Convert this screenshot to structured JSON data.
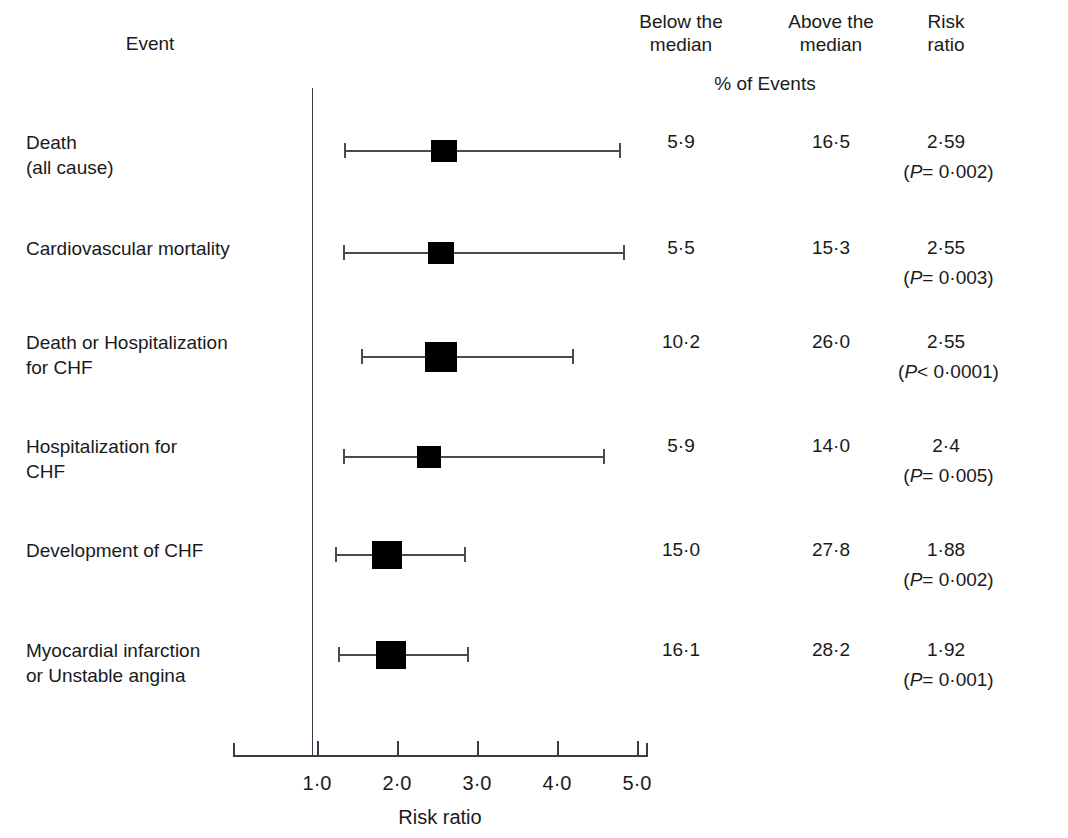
{
  "header": {
    "event_label": "Event",
    "below_median": "Below the\nmedian",
    "above_median": "Above the\nmedian",
    "risk_ratio": "Risk\nratio",
    "pct_of_events": "%  of Events"
  },
  "axis": {
    "title": "Risk ratio",
    "ticks": [
      "1·0",
      "2·0",
      "3·0",
      "4·0",
      "5·0"
    ],
    "tick_values": [
      1.0,
      2.0,
      3.0,
      4.0,
      5.0
    ],
    "reference_line": 1.0
  },
  "chart_data": {
    "type": "forest",
    "title": "",
    "xlabel": "Risk ratio",
    "ylabel": "",
    "xlim": [
      0.8,
      5.2
    ],
    "grid": false,
    "reference_line": 1.0,
    "columns": [
      "Event",
      "Below the median",
      "Above the median",
      "Risk ratio"
    ],
    "column_subheader": "%  of Events",
    "rows": [
      {
        "event": "Death\n(all cause)",
        "below_median_pct": "5·9",
        "above_median_pct": "16·5",
        "risk_ratio": "2·59",
        "p_prefix": "(",
        "p_symbol": "P",
        "p_text": "= 0·002)",
        "rr_value": 2.59,
        "ci_low": 1.34,
        "ci_high": 4.78
      },
      {
        "event": "Cardiovascular mortality",
        "below_median_pct": "5·5",
        "above_median_pct": "15·3",
        "risk_ratio": "2·55",
        "p_prefix": "(",
        "p_symbol": "P",
        "p_text": "= 0·003)",
        "rr_value": 2.55,
        "ci_low": 1.33,
        "ci_high": 4.83
      },
      {
        "event": "Death or Hospitalization\nfor CHF",
        "below_median_pct": "10·2",
        "above_median_pct": "26·0",
        "risk_ratio": "2·55",
        "p_prefix": "(",
        "p_symbol": "P",
        "p_text": "< 0·0001)",
        "rr_value": 2.55,
        "ci_low": 1.55,
        "ci_high": 4.19
      },
      {
        "event": "Hospitalization for\nCHF",
        "below_median_pct": "5·9",
        "above_median_pct": "14·0",
        "risk_ratio": "2·4",
        "p_prefix": "(",
        "p_symbol": "P",
        "p_text": "= 0·005)",
        "rr_value": 2.4,
        "ci_low": 1.33,
        "ci_high": 4.58
      },
      {
        "event": "Development of CHF",
        "below_median_pct": "15·0",
        "above_median_pct": "27·8",
        "risk_ratio": "1·88",
        "p_prefix": "(",
        "p_symbol": "P",
        "p_text": "= 0·002)",
        "rr_value": 1.88,
        "ci_low": 1.22,
        "ci_high": 2.84
      },
      {
        "event": "Myocardial infarction\nor Unstable angina",
        "below_median_pct": "16·1",
        "above_median_pct": "28·2",
        "risk_ratio": "1·92",
        "p_prefix": "(",
        "p_symbol": "P",
        "p_text": "= 0·001)",
        "rr_value": 1.92,
        "ci_low": 1.26,
        "ci_high": 2.88
      }
    ]
  },
  "layout": {
    "row_tops": [
      130,
      236,
      330,
      434,
      538,
      638
    ],
    "marker_centers_y": [
      151,
      253,
      357,
      457,
      555,
      655
    ],
    "marker_widths": [
      26,
      26,
      32,
      24,
      30,
      30
    ],
    "marker_heights": [
      22,
      22,
      30,
      22,
      28,
      28
    ],
    "x_origin_px": 317,
    "px_per_unit": 80
  },
  "colors": {
    "marker": "#000000",
    "line": "#4a4a52",
    "axis": "#3a3a42",
    "text": "#1a1a1a",
    "background": "#ffffff"
  }
}
